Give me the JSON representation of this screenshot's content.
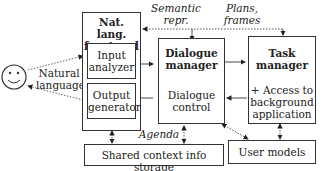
{
  "diagram": {
    "user": {
      "icon": "smiley-face-icon"
    },
    "natural_language_label": [
      "Natural",
      "language"
    ],
    "front_end": {
      "title": [
        "Nat. lang.",
        "front end"
      ],
      "input_analyzer": [
        "Input",
        "analyzer"
      ],
      "output_generator": [
        "Output",
        "generator"
      ]
    },
    "dialogue_manager": {
      "title": [
        "Dialogue",
        "manager"
      ],
      "sub": [
        "Dialogue",
        "control"
      ]
    },
    "task_manager": {
      "title": [
        "Task",
        "manager"
      ],
      "sub": [
        "+ Access to",
        "background",
        "application"
      ]
    },
    "shared_context": "Shared context info storage",
    "user_models": "User models",
    "edge_labels": {
      "semantic_repr": [
        "Semantic",
        "repr."
      ],
      "plans_frames": [
        "Plans,",
        "frames"
      ],
      "agenda": "Agenda"
    }
  }
}
